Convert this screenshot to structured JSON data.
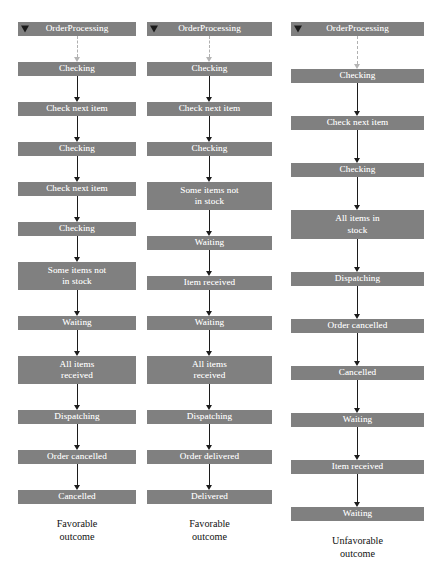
{
  "figure": {
    "type": "uml-sequence-state-traces",
    "background_color": "#ffffff",
    "box_color": "#808080",
    "box_text_color": "#ffffff",
    "arrow_color": "#1c1c1c",
    "initial_arrow_color": "#b0b0b0"
  },
  "columns": [
    {
      "id": "trace-1",
      "caption": "Favorable\noutcome",
      "start_marker": "filled-triangle",
      "steps": [
        {
          "label": "OrderProcessing",
          "lines": 1,
          "incoming_arrow": "none"
        },
        {
          "label": "Checking",
          "lines": 1,
          "incoming_arrow": "dashed"
        },
        {
          "label": "Check next item",
          "lines": 1,
          "incoming_arrow": "solid"
        },
        {
          "label": "Checking",
          "lines": 1,
          "incoming_arrow": "solid"
        },
        {
          "label": "Check next item",
          "lines": 1,
          "incoming_arrow": "solid"
        },
        {
          "label": "Checking",
          "lines": 1,
          "incoming_arrow": "solid"
        },
        {
          "label": "Some items not\nin stock",
          "lines": 2,
          "incoming_arrow": "solid"
        },
        {
          "label": "Waiting",
          "lines": 1,
          "incoming_arrow": "solid"
        },
        {
          "label": "All items\nreceived",
          "lines": 2,
          "incoming_arrow": "solid"
        },
        {
          "label": "Dispatching",
          "lines": 1,
          "incoming_arrow": "solid"
        },
        {
          "label": "Order cancelled",
          "lines": 1,
          "incoming_arrow": "solid"
        },
        {
          "label": "Cancelled",
          "lines": 1,
          "incoming_arrow": "solid"
        }
      ]
    },
    {
      "id": "trace-2",
      "caption": "Favorable\noutcome",
      "start_marker": "filled-triangle",
      "steps": [
        {
          "label": "OrderProcessing",
          "lines": 1,
          "incoming_arrow": "none"
        },
        {
          "label": "Checking",
          "lines": 1,
          "incoming_arrow": "dashed"
        },
        {
          "label": "Check next item",
          "lines": 1,
          "incoming_arrow": "solid"
        },
        {
          "label": "Checking",
          "lines": 1,
          "incoming_arrow": "solid"
        },
        {
          "label": "Some items not\nin stock",
          "lines": 2,
          "incoming_arrow": "solid"
        },
        {
          "label": "Waiting",
          "lines": 1,
          "incoming_arrow": "solid"
        },
        {
          "label": "Item received",
          "lines": 1,
          "incoming_arrow": "solid"
        },
        {
          "label": "Waiting",
          "lines": 1,
          "incoming_arrow": "solid"
        },
        {
          "label": "All items\nreceived",
          "lines": 2,
          "incoming_arrow": "solid"
        },
        {
          "label": "Dispatching",
          "lines": 1,
          "incoming_arrow": "solid"
        },
        {
          "label": "Order delivered",
          "lines": 1,
          "incoming_arrow": "solid"
        },
        {
          "label": "Delivered",
          "lines": 1,
          "incoming_arrow": "solid"
        }
      ]
    },
    {
      "id": "trace-3",
      "caption": "Unfavorable\noutcome",
      "start_marker": "filled-triangle",
      "steps": [
        {
          "label": "OrderProcessing",
          "lines": 1,
          "incoming_arrow": "none"
        },
        {
          "label": "Checking",
          "lines": 1,
          "incoming_arrow": "dashed"
        },
        {
          "label": "Check next item",
          "lines": 1,
          "incoming_arrow": "solid"
        },
        {
          "label": "Checking",
          "lines": 1,
          "incoming_arrow": "solid"
        },
        {
          "label": "All items in\nstock",
          "lines": 2,
          "incoming_arrow": "solid"
        },
        {
          "label": "Dispatching",
          "lines": 1,
          "incoming_arrow": "solid"
        },
        {
          "label": "Order cancelled",
          "lines": 1,
          "incoming_arrow": "solid"
        },
        {
          "label": "Cancelled",
          "lines": 1,
          "incoming_arrow": "solid"
        },
        {
          "label": "Waiting",
          "lines": 1,
          "incoming_arrow": "solid"
        },
        {
          "label": "Item received",
          "lines": 1,
          "incoming_arrow": "solid"
        },
        {
          "label": "Waiting",
          "lines": 1,
          "incoming_arrow": "solid"
        }
      ]
    }
  ]
}
